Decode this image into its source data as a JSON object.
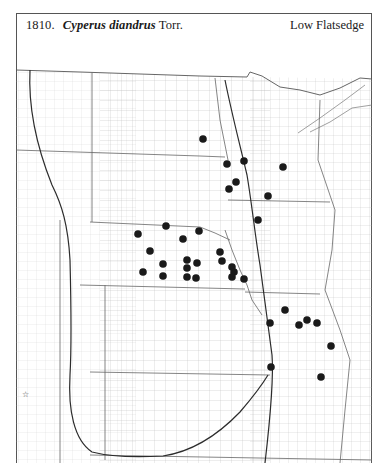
{
  "header": {
    "number": "1810.",
    "scientific_name": "Cyperus diandrus",
    "authority": "Torr.",
    "common_name": "Low Flatsedge"
  },
  "map": {
    "region": "Great Plains, USA (county distribution map)",
    "colors": {
      "line": "#9a9a9a",
      "state_line": "#555555",
      "range_line": "#333333",
      "dot": "#1a1a1a",
      "background": "#ffffff"
    },
    "special_symbol": {
      "glyph": "☆",
      "x": 26,
      "y": 393
    },
    "occurrence_dots": [
      {
        "x": 203,
        "y": 139
      },
      {
        "x": 227,
        "y": 164
      },
      {
        "x": 244,
        "y": 161
      },
      {
        "x": 283,
        "y": 167
      },
      {
        "x": 236,
        "y": 182
      },
      {
        "x": 229,
        "y": 189
      },
      {
        "x": 268,
        "y": 196
      },
      {
        "x": 258,
        "y": 220
      },
      {
        "x": 138,
        "y": 234
      },
      {
        "x": 166,
        "y": 226
      },
      {
        "x": 183,
        "y": 239
      },
      {
        "x": 199,
        "y": 231
      },
      {
        "x": 150,
        "y": 251
      },
      {
        "x": 163,
        "y": 264
      },
      {
        "x": 143,
        "y": 272
      },
      {
        "x": 163,
        "y": 276
      },
      {
        "x": 187,
        "y": 260
      },
      {
        "x": 187,
        "y": 268
      },
      {
        "x": 187,
        "y": 277
      },
      {
        "x": 197,
        "y": 263
      },
      {
        "x": 196,
        "y": 278
      },
      {
        "x": 220,
        "y": 252
      },
      {
        "x": 222,
        "y": 261
      },
      {
        "x": 232,
        "y": 267
      },
      {
        "x": 234,
        "y": 272
      },
      {
        "x": 232,
        "y": 277
      },
      {
        "x": 244,
        "y": 279
      },
      {
        "x": 285,
        "y": 310
      },
      {
        "x": 270,
        "y": 323
      },
      {
        "x": 299,
        "y": 325
      },
      {
        "x": 307,
        "y": 320
      },
      {
        "x": 317,
        "y": 323
      },
      {
        "x": 331,
        "y": 346
      },
      {
        "x": 271,
        "y": 367
      },
      {
        "x": 321,
        "y": 377
      }
    ]
  }
}
